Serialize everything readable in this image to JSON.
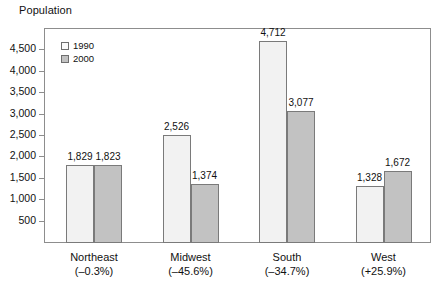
{
  "chart_data": {
    "type": "bar",
    "title": "",
    "ylabel": "Population",
    "xlabel": "",
    "categories": [
      "Northeast",
      "Midwest",
      "South",
      "West"
    ],
    "category_sublabels": [
      "(–0.3%)",
      "(–45.6%)",
      "(–34.7%)",
      "(+25.9%)"
    ],
    "series": [
      {
        "name": "1990",
        "values": [
          1829,
          2526,
          4712,
          1328
        ],
        "color": "#f2f2f2"
      },
      {
        "name": "2000",
        "values": [
          1823,
          1374,
          3077,
          1672
        ],
        "color": "#c2c2c2"
      }
    ],
    "value_labels": [
      [
        "1,829",
        "2,526",
        "4,712",
        "1,328"
      ],
      [
        "1,823",
        "1,374",
        "3,077",
        "1,672"
      ]
    ],
    "ylim": [
      0,
      5000
    ],
    "yticks": [
      500,
      1000,
      1500,
      2000,
      2500,
      3000,
      3500,
      4000,
      4500
    ],
    "ytick_labels": [
      "500",
      "1,000",
      "1,500",
      "2,000",
      "2,500",
      "3,000",
      "3,500",
      "4,000",
      "4,500"
    ],
    "grid": false,
    "legend_position": "top-left",
    "legend_entries": [
      "1990",
      "2000"
    ]
  },
  "axis": {
    "y_title": "Population"
  },
  "colors": {
    "series_1990": "#f2f2f2",
    "series_2000": "#c2c2c2",
    "axis_line": "#8d8d8d",
    "bar_outline": "#7a7a7a",
    "text": "#111111",
    "background": "#ffffff"
  }
}
